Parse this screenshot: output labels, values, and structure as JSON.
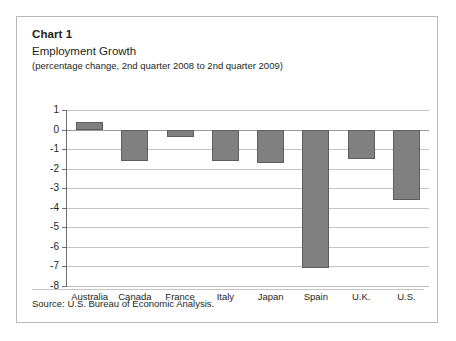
{
  "panel": {
    "chart_number": "Chart 1",
    "title": "Employment Growth",
    "subtitle": "(percentage change, 2nd quarter 2008 to 2nd quarter 2009)",
    "source": "Source: U.S. Bureau of Economic Analysis."
  },
  "colors": {
    "bar_fill": "#808080",
    "bar_stroke": "#5d5d5d",
    "gridline": "#c4c4c4",
    "axis": "#6e6e6e",
    "panel_border": "#b9b9b9",
    "background": "#ffffff",
    "text": "#231f20"
  },
  "chart_data": {
    "type": "bar",
    "title": "Employment Growth",
    "subtitle": "(percentage change, 2nd quarter 2008 to 2nd quarter 2009)",
    "xlabel": "",
    "ylabel": "",
    "ylim": [
      -8,
      1
    ],
    "yticks": [
      1,
      0,
      -1,
      -2,
      -3,
      -4,
      -5,
      -6,
      -7,
      -8
    ],
    "ytick_labels": [
      "1",
      "0",
      "-1",
      "-2",
      "-3",
      "-4",
      "-5",
      "-6",
      "-7",
      "-8"
    ],
    "grid": true,
    "legend": false,
    "categories": [
      "Australia",
      "Canada",
      "France",
      "Italy",
      "Japan",
      "Spain",
      "U.K.",
      "U.S."
    ],
    "values": [
      0.4,
      -1.6,
      -0.4,
      -1.6,
      -1.7,
      -7.1,
      -1.5,
      -3.6
    ]
  }
}
